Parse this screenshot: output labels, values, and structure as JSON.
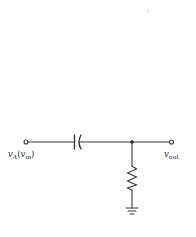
{
  "diagram": {
    "type": "circuit-schematic",
    "colors": {
      "wire": "#3a3a3a",
      "background": "#ffffff"
    },
    "components": [
      {
        "id": "C",
        "kind": "capacitor",
        "placement": "series"
      },
      {
        "id": "R",
        "kind": "resistor",
        "placement": "shunt-to-ground"
      },
      {
        "id": "GND",
        "kind": "ground"
      }
    ],
    "nodes": {
      "input": {
        "label_main": "v",
        "label_sub": "A",
        "label_paren_open": "(",
        "label_paren_var": "v",
        "label_paren_sub": "in",
        "label_paren_close": ")"
      },
      "output": {
        "label_main": "v",
        "label_sub": "out"
      }
    }
  }
}
